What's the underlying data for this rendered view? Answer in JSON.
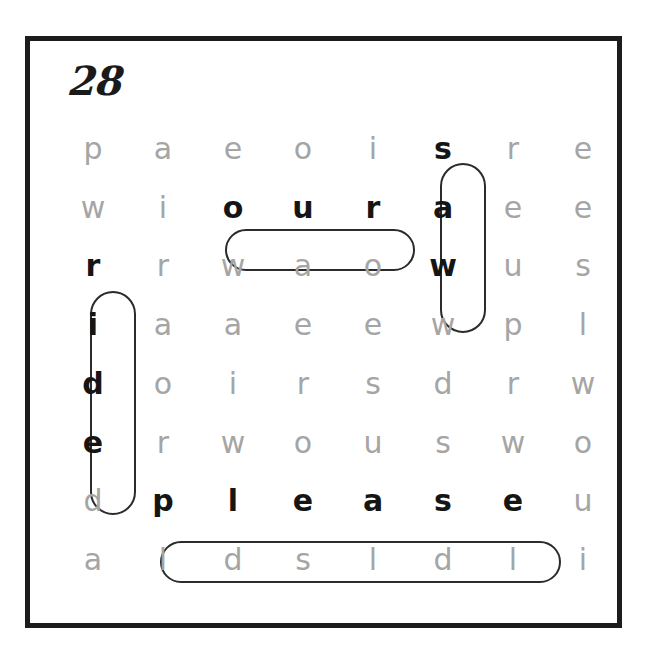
{
  "worksheet": {
    "puzzle_number": "28",
    "grid_rows": 8,
    "grid_cols": 8,
    "letter_color": "#a5a5a5",
    "found_letter_color": "#151515",
    "border_color": "#1c1c1c",
    "pill_color": "#2b2b2b",
    "background_color": "#ffffff"
  },
  "grid": {
    "rows": [
      [
        "p",
        "a",
        "e",
        "o",
        "i",
        "s",
        "r",
        "e"
      ],
      [
        "w",
        "i",
        "o",
        "u",
        "r",
        "a",
        "e",
        "e"
      ],
      [
        "r",
        "r",
        "w",
        "a",
        "o",
        "w",
        "u",
        "s"
      ],
      [
        "i",
        "a",
        "a",
        "e",
        "e",
        "w",
        "p",
        "l"
      ],
      [
        "d",
        "o",
        "i",
        "r",
        "s",
        "d",
        "r",
        "w"
      ],
      [
        "e",
        "r",
        "w",
        "o",
        "u",
        "s",
        "w",
        "o"
      ],
      [
        "d",
        "p",
        "l",
        "e",
        "a",
        "s",
        "e",
        "u"
      ],
      [
        "a",
        "l",
        "d",
        "s",
        "l",
        "d",
        "l",
        "i"
      ]
    ],
    "found_cells": [
      [
        0,
        5
      ],
      [
        1,
        2
      ],
      [
        1,
        3
      ],
      [
        1,
        4
      ],
      [
        1,
        5
      ],
      [
        2,
        0
      ],
      [
        2,
        5
      ],
      [
        3,
        0
      ],
      [
        4,
        0
      ],
      [
        5,
        0
      ],
      [
        6,
        1
      ],
      [
        6,
        2
      ],
      [
        6,
        3
      ],
      [
        6,
        4
      ],
      [
        6,
        5
      ],
      [
        6,
        6
      ]
    ]
  },
  "found_words": [
    {
      "word": "saw",
      "orientation": "vertical",
      "start_row": 1,
      "start_col": 6,
      "end_row": 3,
      "end_col": 6,
      "pill": {
        "left": 382,
        "top": 44,
        "width": 46,
        "height": 170
      }
    },
    {
      "word": "our",
      "orientation": "horizontal",
      "start_row": 2,
      "start_col": 3,
      "end_row": 2,
      "end_col": 5,
      "pill": {
        "left": 167,
        "top": 110,
        "width": 190,
        "height": 42
      }
    },
    {
      "word": "ride",
      "orientation": "vertical",
      "start_row": 3,
      "start_col": 1,
      "end_row": 6,
      "end_col": 1,
      "pill": {
        "left": 32,
        "top": 172,
        "width": 46,
        "height": 224
      }
    },
    {
      "word": "please",
      "orientation": "horizontal",
      "start_row": 7,
      "start_col": 2,
      "end_row": 7,
      "end_col": 7,
      "pill": {
        "left": 102,
        "top": 422,
        "width": 401,
        "height": 42
      }
    }
  ]
}
